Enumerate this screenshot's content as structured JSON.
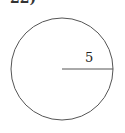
{
  "problem": {
    "number_label": "22)"
  },
  "figure": {
    "shape": "circle",
    "center": [
      62,
      69
    ],
    "radius_px": 51,
    "stroke_color": "#555555",
    "radius_segment": {
      "from": [
        62,
        69
      ],
      "to": [
        113,
        69
      ],
      "label": "5",
      "label_pos": [
        88,
        62
      ]
    }
  }
}
